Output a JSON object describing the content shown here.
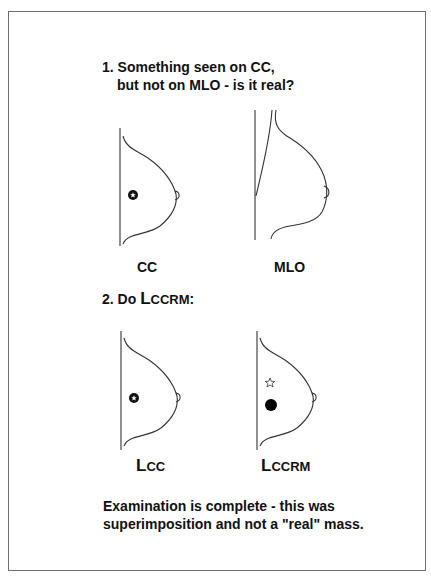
{
  "step1": {
    "line1": "1. Something seen on CC,",
    "line2": "but not on MLO - is it real?"
  },
  "step2": {
    "prefix": "2. Do ",
    "big_letter": "L",
    "small_caps": "CCRM",
    "suffix": ":"
  },
  "views": [
    {
      "id": "cc",
      "label_big": "",
      "label_rest": "CC",
      "findings": [
        "star-in-circle mass"
      ]
    },
    {
      "id": "mlo",
      "label_big": "",
      "label_rest": "MLO",
      "findings": []
    },
    {
      "id": "lcc",
      "label_big": "L",
      "label_rest": "CC",
      "findings": [
        "star-in-circle mass"
      ]
    },
    {
      "id": "lccrm",
      "label_big": "L",
      "label_rest": "CCRM",
      "findings": [
        "outline star",
        "filled black circle"
      ]
    }
  ],
  "conclusion": {
    "line1": "Examination is complete - this was",
    "line2": "superimposition and not a \"real\" mass."
  },
  "colors": {
    "line": "#333333",
    "text": "#111111",
    "frame": "#6e6e6e",
    "background": "#ffffff"
  }
}
